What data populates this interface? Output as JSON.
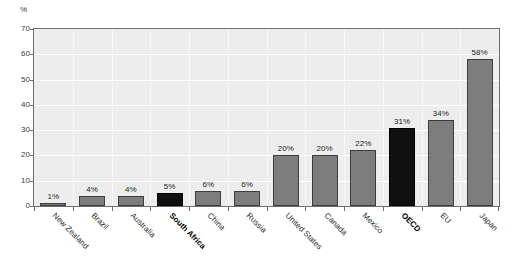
{
  "chart_data": {
    "type": "bar",
    "title": "",
    "subtitle": "",
    "xlabel": "",
    "ylabel": "%",
    "ylim": [
      0,
      70
    ],
    "ytick_step": 10,
    "yticks": [
      "70",
      "60",
      "50",
      "40",
      "30",
      "20",
      "10",
      "0"
    ],
    "grid": true,
    "grid_orientation": "horizontal",
    "legend": "none",
    "value_label_suffix": "%",
    "categories": [
      "New Zealand",
      "Brazil",
      "Australia",
      "South Africa",
      "China",
      "Russia",
      "United States",
      "Canada",
      "Mexico",
      "OECD",
      "EU",
      "Japan"
    ],
    "values": [
      1,
      4,
      4,
      5,
      6,
      6,
      20,
      20,
      22,
      31,
      34,
      58
    ],
    "value_labels": [
      "1%",
      "4%",
      "4%",
      "5%",
      "6%",
      "6%",
      "20%",
      "20%",
      "22%",
      "31%",
      "34%",
      "58%"
    ],
    "highlighted": [
      false,
      false,
      false,
      true,
      false,
      false,
      false,
      false,
      false,
      true,
      false,
      false
    ],
    "bold_labels": [
      false,
      false,
      false,
      true,
      false,
      false,
      false,
      false,
      false,
      true,
      false,
      false
    ],
    "colors": {
      "bar": "#7d7d7d",
      "bar_highlight": "#101010",
      "bar_border": "#3d3d3d",
      "plot_background": "#ededed",
      "gridline": "#ffffff",
      "axis": "#6e6e6e",
      "text": "#2b2b2b",
      "page_background": "#ffffff"
    }
  }
}
